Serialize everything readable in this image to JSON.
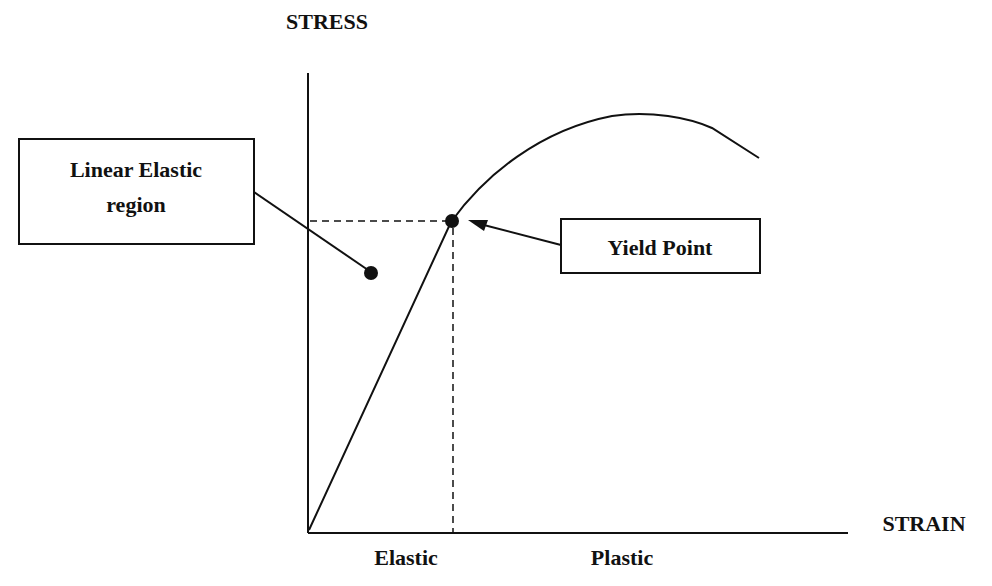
{
  "diagram": {
    "type": "stress-strain curve",
    "colors": {
      "ink": "#111111",
      "background": "#ffffff"
    },
    "axes": {
      "y_label": "STRESS",
      "x_label": "STRAIN"
    },
    "regions": {
      "elastic_label": "Elastic",
      "plastic_label": "Plastic"
    },
    "callouts": {
      "linear_elastic": {
        "line1": "Linear Elastic",
        "line2": "region"
      },
      "yield_point": {
        "label": "Yield Point"
      }
    }
  }
}
